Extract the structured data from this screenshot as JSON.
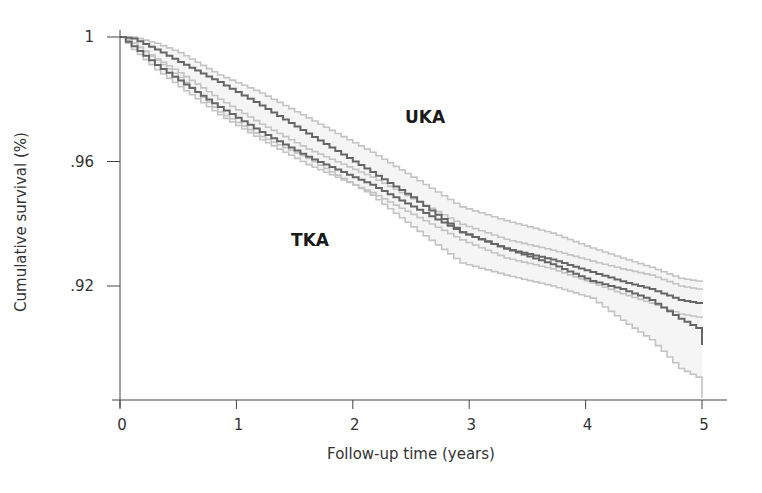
{
  "chart_data": {
    "type": "line",
    "subtype": "kaplan-meier step curves with confidence bands",
    "title": "",
    "xlabel": "Follow-up time (years)",
    "ylabel": "Cumulative survival (%)",
    "xlim": [
      0,
      5.2
    ],
    "ylim": [
      0.883,
      1.0
    ],
    "x_ticks": [
      0,
      1,
      2,
      3,
      4,
      5
    ],
    "x_tick_labels": [
      "0",
      "1",
      "2",
      "3",
      "4",
      "5"
    ],
    "y_ticks": [
      1.0,
      0.96,
      0.92
    ],
    "y_tick_labels": [
      "1",
      ".96",
      ".92"
    ],
    "grid": false,
    "legend": "none (inline labels)",
    "annotations": [
      {
        "text": "UKA",
        "x": 2.6,
        "y": 0.974
      },
      {
        "text": "TKA",
        "x": 1.6,
        "y": 0.9375
      }
    ],
    "colors": {
      "main_line": "#666666",
      "ci_line": "#c4c4c4",
      "ci_fill": "#f3f3f3",
      "axis": "#444444"
    },
    "series": [
      {
        "name": "UKA",
        "x": [
          0,
          0.1,
          0.3,
          0.5,
          0.84,
          1.2,
          1.6,
          2.15,
          2.5,
          2.92,
          3.3,
          3.7,
          4.04,
          4.3,
          4.55,
          4.8,
          5.0,
          5.0
        ],
        "values": [
          1.0,
          0.9995,
          0.996,
          0.992,
          0.9855,
          0.978,
          0.969,
          0.9566,
          0.9485,
          0.9373,
          0.932,
          0.927,
          0.9216,
          0.919,
          0.9155,
          0.9095,
          0.9055,
          0.901
        ],
        "ci_upper": [
          1.0,
          1.0,
          0.998,
          0.995,
          0.9878,
          0.982,
          0.974,
          0.963,
          0.955,
          0.9454,
          0.941,
          0.937,
          0.9322,
          0.929,
          0.926,
          0.9225,
          0.9213,
          0.9213
        ],
        "ci_lower": [
          1.0,
          0.998,
          0.9925,
          0.987,
          0.9759,
          0.968,
          0.961,
          0.9492,
          0.939,
          0.9274,
          0.9235,
          0.92,
          0.9161,
          0.909,
          0.9027,
          0.8935,
          0.8898,
          0.884
        ]
      },
      {
        "name": "TKA",
        "x": [
          0,
          0.1,
          0.3,
          0.5,
          0.84,
          1.2,
          1.6,
          2.15,
          2.5,
          2.92,
          3.3,
          3.7,
          4.04,
          4.3,
          4.55,
          4.8,
          5.0
        ],
        "values": [
          1.0,
          0.997,
          0.991,
          0.986,
          0.9775,
          0.9695,
          0.9615,
          0.9525,
          0.9455,
          0.9373,
          0.932,
          0.9285,
          0.9245,
          0.9215,
          0.919,
          0.9155,
          0.9142
        ],
        "ci_upper": [
          1.0,
          0.998,
          0.993,
          0.9885,
          0.98,
          0.972,
          0.964,
          0.955,
          0.948,
          0.9398,
          0.935,
          0.9315,
          0.928,
          0.9255,
          0.9235,
          0.92,
          0.9187
        ],
        "ci_lower": [
          1.0,
          0.996,
          0.9895,
          0.984,
          0.975,
          0.967,
          0.959,
          0.95,
          0.943,
          0.9348,
          0.929,
          0.9255,
          0.921,
          0.9175,
          0.9145,
          0.911,
          0.9097
        ]
      }
    ]
  },
  "plot_area": {
    "x0_px": 120,
    "px_per_year": 116.4,
    "y_top_px": 37,
    "px_per_unit_y": 3112.5,
    "x_axis_y_px": 400,
    "x_axis_end_px": 727,
    "y_axis_top_px": 30
  }
}
